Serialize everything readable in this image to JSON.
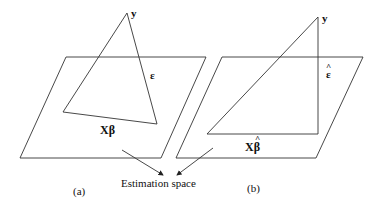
{
  "diagram": {
    "panel_a": {
      "caption": "(a)",
      "vertex_label": "y",
      "error_label": "ε",
      "projection_label": "Xβ"
    },
    "panel_b": {
      "caption": "(b)",
      "vertex_label": "y",
      "error_label": "ε",
      "error_hat": "^",
      "projection_label": "Xβ",
      "projection_hat": "^"
    },
    "shared_label": "Estimation space"
  }
}
